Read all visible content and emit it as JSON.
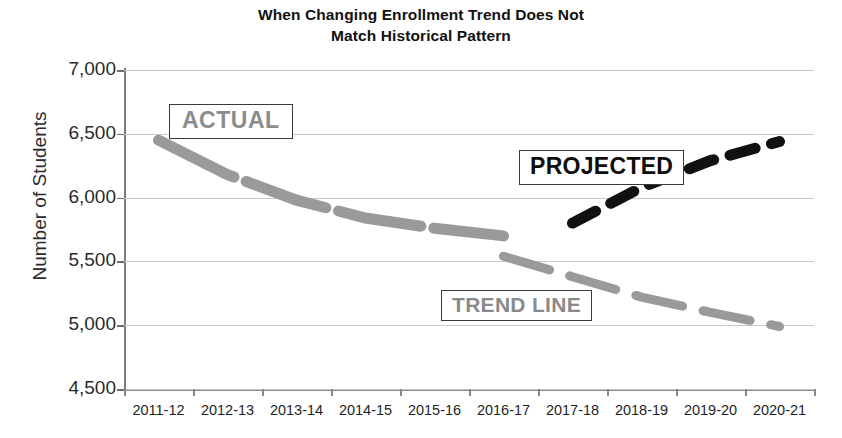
{
  "chart_data": {
    "type": "line",
    "title": "When Changing Enrollment Trend Does Not Match Historical Pattern",
    "title_lines": [
      "When Changing Enrollment Trend Does Not",
      "Match Historical Pattern"
    ],
    "xlabel": "",
    "ylabel": "Number of Students",
    "ylim": [
      4500,
      7000
    ],
    "ytick_labels": [
      "7,000",
      "6,500",
      "6,000",
      "5,500",
      "5,000",
      "4,500"
    ],
    "ytick_values": [
      7000,
      6500,
      6000,
      5500,
      5000,
      4500
    ],
    "categories": [
      "2011-12",
      "2012-13",
      "2013-14",
      "2014-15",
      "2015-16",
      "2016-17",
      "2017-18",
      "2018-19",
      "2019-20",
      "2020-21"
    ],
    "grid": true,
    "legend": "none",
    "series": [
      {
        "name": "ACTUAL",
        "style": "dashed-thick-gray",
        "color": "#9a9a9a",
        "x": [
          "2011-12",
          "2012-13",
          "2013-14",
          "2014-15",
          "2015-16",
          "2016-17"
        ],
        "values": [
          6450,
          6180,
          5980,
          5840,
          5760,
          5700
        ]
      },
      {
        "name": "TREND LINE",
        "style": "dashed-gray",
        "color": "#9a9a9a",
        "x": [
          "2016-17",
          "2017-18",
          "2018-19",
          "2019-20",
          "2020-21"
        ],
        "values": [
          5540,
          5380,
          5220,
          5100,
          4990
        ]
      },
      {
        "name": "PROJECTED",
        "style": "dashed-black",
        "color": "#111111",
        "x": [
          "2017-18",
          "2018-19",
          "2019-20",
          "2020-21"
        ],
        "values": [
          5800,
          6080,
          6290,
          6440
        ]
      }
    ],
    "annotations": [
      {
        "text": "ACTUAL",
        "color": "#8c8c8c",
        "boxed": true
      },
      {
        "text": "PROJECTED",
        "color": "#0d0d0d",
        "boxed": true
      },
      {
        "text": "TREND LINE",
        "color": "#8a8a8a",
        "boxed": true
      }
    ]
  }
}
